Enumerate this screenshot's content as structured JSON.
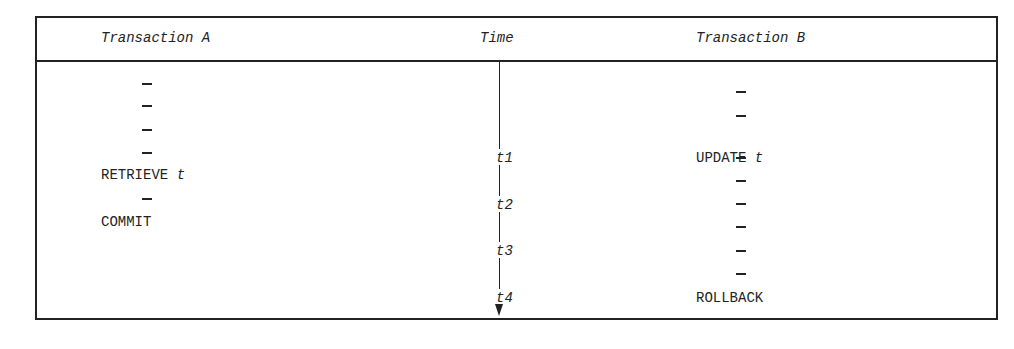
{
  "headers": {
    "transaction_a": "Transaction A",
    "time": "Time",
    "transaction_b": "Transaction B"
  },
  "transaction_a": {
    "retrieve": "RETRIEVE",
    "retrieve_var": "t",
    "commit": "COMMIT",
    "dashes": 5
  },
  "transaction_b": {
    "update": "UPDATE",
    "update_var": "t",
    "rollback": "ROLLBACK",
    "dashes": 7
  },
  "time_labels": [
    "t1",
    "t2",
    "t3",
    "t4"
  ]
}
